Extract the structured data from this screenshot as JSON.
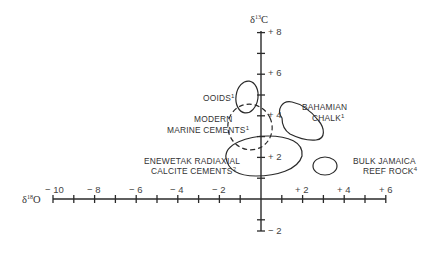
{
  "chart_data": {
    "type": "scatter",
    "title": "",
    "xlabel": "δ18O",
    "ylabel": "δ13C",
    "x_axis": {
      "min": -10,
      "max": 6,
      "tick_step": 1,
      "labeled_ticks": [
        -10,
        -8,
        -6,
        -4,
        -2,
        2,
        4,
        6
      ],
      "tick_labels": [
        "− 10",
        "− 8",
        "− 6",
        "− 4",
        "− 2",
        "+ 2",
        "+ 4",
        "+ 6"
      ]
    },
    "y_axis": {
      "min": -2,
      "max": 8,
      "tick_step": 1,
      "labeled_ticks": [
        8,
        6,
        4,
        2,
        -2
      ],
      "tick_labels": [
        "+ 8",
        "+ 6",
        "+ 4",
        "+ 2",
        "− 2"
      ]
    },
    "grid": false,
    "legend": "none (fields labeled directly)",
    "fields": [
      {
        "name": "OOIDS",
        "ref": "1",
        "style": "solid",
        "center": [
          -0.7,
          4.8
        ],
        "extent_x": [
          -1.2,
          -0.1
        ],
        "extent_y": [
          4.0,
          5.6
        ]
      },
      {
        "name": "MODERN MARINE CEMENTS",
        "ref": "1",
        "style": "dashed",
        "center": [
          -0.6,
          3.1
        ],
        "extent_x": [
          -1.6,
          0.6
        ],
        "extent_y": [
          1.9,
          4.1
        ]
      },
      {
        "name": "BAHAMIAN CHALK",
        "ref": "1",
        "style": "solid",
        "center": [
          1.8,
          3.3
        ],
        "extent_x": [
          0.8,
          3.0
        ],
        "extent_y": [
          2.3,
          4.2
        ]
      },
      {
        "name": "ENEWETAK RADIAXIAL CALCITE CEMENTS",
        "ref": "2",
        "style": "solid",
        "center": [
          0.2,
          1.8
        ],
        "extent_x": [
          -1.8,
          2.1
        ],
        "extent_y": [
          0.5,
          3.0
        ]
      },
      {
        "name": "BULK JAMAICA REEF ROCK",
        "ref": "4",
        "style": "solid",
        "center": [
          3.1,
          1.2
        ],
        "extent_x": [
          2.5,
          3.8
        ],
        "extent_y": [
          0.8,
          1.7
        ]
      }
    ]
  },
  "labels": {
    "y_title_main": "δ",
    "y_title_sup": "13",
    "y_title_tail": "C",
    "x_title_main": "δ",
    "x_title_sup": "18",
    "x_title_tail": "O",
    "ooids": "OOIDS",
    "ooids_ref": "1",
    "modern_1": "MODERN",
    "modern_2": "MARINE CEMENTS",
    "modern_ref": "1",
    "bahamian_1": "BAHAMIAN",
    "bahamian_2": "CHALK",
    "bahamian_ref": "1",
    "enewetak_1": "ENEWETAK RADIAXIAL",
    "enewetak_2": "CALCITE CEMENTS",
    "enewetak_ref": "2",
    "jamaica_1": "BULK JAMAICA",
    "jamaica_2": "REEF ROCK",
    "jamaica_ref": "4",
    "x_ticks": [
      "− 10",
      "− 8",
      "− 6",
      "− 4",
      "− 2",
      "+ 2",
      "+ 4",
      "+ 6"
    ],
    "y_ticks": [
      "+ 8",
      "+ 6",
      "+ 4",
      "+ 2",
      "− 2"
    ]
  },
  "colors": {
    "ink": "#2a2a2a",
    "background": "#ffffff"
  }
}
